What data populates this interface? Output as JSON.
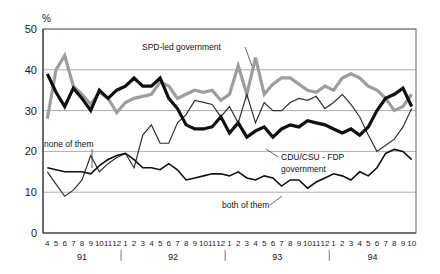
{
  "axes": {
    "y_unit_label": "%",
    "y_ticks": [
      "0",
      "10",
      "20",
      "30",
      "40",
      "50"
    ],
    "y_min": 0,
    "y_max": 50,
    "x_ticks": [
      "4",
      "5",
      "6",
      "7",
      "8",
      "9",
      "10",
      "11",
      "12",
      "1",
      "2",
      "3",
      "4",
      "5",
      "6",
      "7",
      "8",
      "9",
      "10",
      "11",
      "12",
      "1",
      "2",
      "3",
      "4",
      "5",
      "6",
      "7",
      "8",
      "9",
      "10",
      "11",
      "12",
      "1",
      "2",
      "3",
      "4",
      "5",
      "6",
      "7",
      "8",
      "9",
      "10"
    ],
    "year_labels": [
      "91",
      "92",
      "93",
      "94"
    ]
  },
  "annotations": {
    "spd": "SPD-led government",
    "none": "none of them",
    "cdu_line1": "CDU/CSU - FDP",
    "cdu_line2": "government",
    "both": "both of them"
  },
  "colors": {
    "spd_line": "#9e9e9e",
    "cdu_line": "#101010",
    "none_line": "#303030",
    "both_line": "#101010",
    "grid": "#8c8c8c",
    "frame": "#6e6e6e",
    "text": "#1a1a1a"
  },
  "chart_data": {
    "type": "line",
    "title": "",
    "xlabel": "",
    "ylabel": "%",
    "ylim": [
      0,
      50
    ],
    "grid": true,
    "legend": "annotations-inline",
    "x": [
      "4/91",
      "5/91",
      "6/91",
      "7/91",
      "8/91",
      "9/91",
      "10/91",
      "11/91",
      "12/91",
      "1/92",
      "2/92",
      "3/92",
      "4/92",
      "5/92",
      "6/92",
      "7/92",
      "8/92",
      "9/92",
      "10/92",
      "11/92",
      "12/92",
      "1/93",
      "2/93",
      "3/93",
      "4/93",
      "5/93",
      "6/93",
      "7/93",
      "8/93",
      "9/93",
      "10/93",
      "11/93",
      "12/93",
      "1/94",
      "2/94",
      "3/94",
      "4/94",
      "5/94",
      "6/94",
      "7/94",
      "8/94",
      "9/94",
      "10/94"
    ],
    "series": [
      {
        "name": "SPD-led government",
        "color": "#9e9e9e",
        "width": 3.2,
        "values": [
          28,
          40,
          43.5,
          36,
          34,
          31.5,
          34.5,
          33,
          29.5,
          32,
          33,
          33.5,
          34,
          37,
          36,
          33,
          34,
          35,
          34.5,
          35,
          32.5,
          34,
          41,
          34,
          43,
          34,
          36.5,
          38,
          38,
          36.5,
          35,
          34.5,
          36,
          35,
          38,
          39,
          38,
          36,
          35,
          33,
          30,
          31,
          34
        ]
      },
      {
        "name": "CDU/CSU - FDP government",
        "color": "#101010",
        "width": 3.2,
        "values": [
          39,
          34.5,
          31,
          35.5,
          33,
          30,
          35,
          33,
          35,
          36,
          38,
          36,
          36,
          38,
          33,
          30.5,
          26.5,
          25.5,
          25.5,
          26,
          28.5,
          24.5,
          27,
          23.5,
          25,
          26,
          23.5,
          25.5,
          26.5,
          26,
          27.5,
          27,
          26.5,
          25.5,
          24.5,
          25.5,
          24,
          26,
          30,
          33,
          34,
          35.5,
          31
        ]
      },
      {
        "name": "none of them",
        "color": "#303030",
        "width": 1.2,
        "values": [
          15,
          12,
          9,
          10.5,
          13,
          19,
          15,
          17,
          18.5,
          19.5,
          16,
          24,
          26.5,
          22,
          22,
          27,
          29,
          32.5,
          32,
          31.5,
          28.5,
          31,
          27,
          34,
          27,
          32,
          30,
          30,
          32,
          33,
          32.5,
          33.5,
          30.5,
          32,
          34,
          31.5,
          28.5,
          24,
          20,
          21.5,
          23,
          26,
          30.5
        ]
      },
      {
        "name": "both of them",
        "color": "#101010",
        "width": 1.6,
        "values": [
          16,
          15.5,
          15,
          15,
          15,
          14.5,
          16.5,
          18,
          19,
          19.5,
          18,
          16,
          16,
          15.5,
          17,
          15.5,
          13,
          13.5,
          14,
          14.5,
          14.5,
          14,
          15,
          13.5,
          13,
          14,
          13.5,
          11.5,
          13,
          13,
          11,
          12.5,
          13.5,
          14.5,
          14,
          13,
          15,
          14,
          16,
          19.5,
          20.5,
          20,
          18
        ]
      }
    ]
  }
}
